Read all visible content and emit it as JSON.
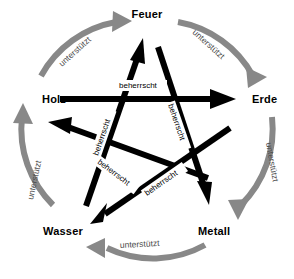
{
  "diagram": {
    "colors": {
      "generating_arc": "#888888",
      "controlling_arrow": "#000000",
      "background": "#ffffff",
      "node_text": "#000000",
      "cycle_text": "#4a4a4a"
    },
    "nodes": [
      {
        "id": "feuer",
        "label": "Feuer",
        "position": "top"
      },
      {
        "id": "erde",
        "label": "Erde",
        "position": "right"
      },
      {
        "id": "metall",
        "label": "Metall",
        "position": "bottom-right"
      },
      {
        "id": "wasser",
        "label": "Wasser",
        "position": "bottom-left"
      },
      {
        "id": "holz",
        "label": "Holz",
        "position": "left"
      }
    ],
    "generating_cycle": {
      "relation": "unterstützt",
      "edges": [
        {
          "from": "Holz",
          "to": "Feuer",
          "label": "unterstützt"
        },
        {
          "from": "Feuer",
          "to": "Erde",
          "label": "unterstützt"
        },
        {
          "from": "Erde",
          "to": "Metall",
          "label": "unterstützt"
        },
        {
          "from": "Metall",
          "to": "Wasser",
          "label": "unterstützt"
        },
        {
          "from": "Wasser",
          "to": "Holz",
          "label": "unterstützt"
        }
      ]
    },
    "controlling_cycle": {
      "relation": "beherrscht",
      "edges": [
        {
          "from": "Holz",
          "to": "Erde",
          "label": "beherrscht"
        },
        {
          "from": "Erde",
          "to": "Wasser",
          "label": "beherrscht"
        },
        {
          "from": "Wasser",
          "to": "Feuer",
          "label": "beherrscht"
        },
        {
          "from": "Feuer",
          "to": "Metall",
          "label": "beherrscht"
        },
        {
          "from": "Metall",
          "to": "Holz",
          "label": "beherrscht"
        }
      ]
    }
  }
}
